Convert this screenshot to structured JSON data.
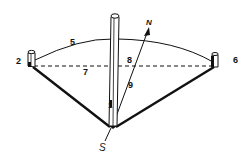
{
  "diagram": {
    "colors": {
      "ink": "#111111",
      "background": "#ffffff"
    },
    "labels": {
      "l1": "1",
      "l2": "2",
      "l5": "5",
      "l6": "6",
      "l7": "7",
      "l8": "8",
      "l9": "9",
      "north": "N",
      "south": "S"
    },
    "elements": [
      {
        "id": "1",
        "name": "central tall post"
      },
      {
        "id": "2",
        "name": "left short post"
      },
      {
        "id": "5",
        "name": "arc between posts"
      },
      {
        "id": "6",
        "name": "right short post"
      },
      {
        "id": "7",
        "name": "dashed baseline"
      },
      {
        "id": "8",
        "name": "intersection of N-S line with baseline"
      },
      {
        "id": "9",
        "name": "N-S line segment"
      },
      {
        "id": "N",
        "name": "north arrow"
      },
      {
        "id": "S",
        "name": "south direction"
      }
    ]
  }
}
